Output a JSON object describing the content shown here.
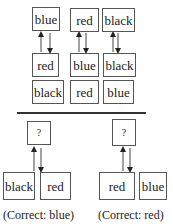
{
  "top_panel": {
    "columns": [
      {
        "target": "blue",
        "middle": "red",
        "bottom": "black"
      },
      {
        "target": "red",
        "middle": "blue",
        "bottom": "red"
      },
      {
        "target": "black",
        "middle": "black",
        "bottom": "blue"
      }
    ]
  },
  "bottom_panel": {
    "examples": [
      {
        "query": "?",
        "options": [
          "black",
          "red"
        ],
        "caption": "(Correct: blue)"
      },
      {
        "query": "?",
        "options": [
          "red",
          "blue"
        ],
        "caption": "(Correct: red)"
      }
    ]
  }
}
